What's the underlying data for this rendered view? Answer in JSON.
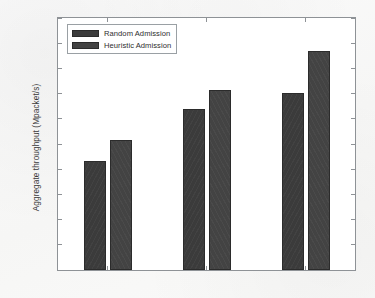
{
  "chart_data": {
    "type": "bar",
    "title": "",
    "xlabel": "",
    "ylabel": "Aggregate throughput (Mpacket/s)",
    "categories": [
      "Scenario 1",
      "Scenario 2",
      "Scenario 3"
    ],
    "series": [
      {
        "name": "Random Admission",
        "values": [
          217,
          320,
          351
        ],
        "color": "#3b3b3b"
      },
      {
        "name": "Heuristic Admission",
        "values": [
          257,
          357,
          435
        ],
        "color": "#434343"
      }
    ],
    "ylim": [
      0,
      500
    ],
    "ytick_step": 50,
    "yticks": [
      0,
      50,
      100,
      150,
      200,
      250,
      300,
      350,
      400,
      450,
      500
    ],
    "ytick_labels": [
      "0",
      "50",
      "100",
      "150",
      "200",
      "250",
      "300",
      "350",
      "400",
      "450",
      "500"
    ],
    "grid": false,
    "legend_position": "upper left",
    "legend_entries": [
      "Random Admission",
      "Heuristic Admission"
    ]
  }
}
